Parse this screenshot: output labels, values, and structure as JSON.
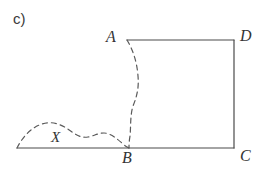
{
  "figure": {
    "part_label": "c)",
    "colors": {
      "solid_stroke": "#4a4a4a",
      "dashed_stroke": "#5a5a5a",
      "text": "#333333",
      "background": "#ffffff"
    },
    "vertices": [
      {
        "key": "A",
        "label": "A",
        "x": 127,
        "y": 40
      },
      {
        "key": "D",
        "label": "D",
        "x": 234,
        "y": 40
      },
      {
        "key": "C",
        "label": "C",
        "x": 234,
        "y": 148
      },
      {
        "key": "B",
        "label": "B",
        "x": 129,
        "y": 148
      }
    ],
    "region_label": "X",
    "solid_paths": [
      {
        "name": "segment-AD",
        "d": "M 127 40 L 234 40"
      },
      {
        "name": "segment-DC",
        "d": "M 234 40 L 234 148"
      },
      {
        "name": "baseline-left-to-C",
        "d": "M 17 148 L 234 148"
      }
    ],
    "dashed_paths": [
      {
        "name": "curve-A-to-B",
        "d": "M 127 40 C 133 50 137 62 138 76 C 139 88 137 96 133 106 C 130 116 131 126 130 136 C 129 142 129 145 129 148"
      },
      {
        "name": "curve-X-boundary",
        "d": "M 17 148 C 22 138 30 128 42 124 C 54 120 64 126 72 132 C 78 136 82 138 88 137 C 94 136 98 133 104 133 C 110 133 116 138 122 143 C 125 146 127 147 129 148"
      }
    ],
    "dash_pattern": "5 4"
  }
}
